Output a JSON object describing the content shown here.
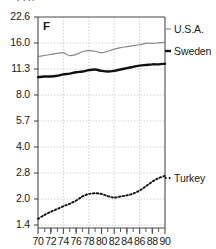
{
  "chart_data": {
    "type": "line",
    "title": "",
    "xlabel": "",
    "ylabel": "F",
    "yscale": "log",
    "ylim": [
      1.4,
      22.6
    ],
    "xlim": [
      70,
      90
    ],
    "grid": true,
    "legend_position": "right-of-plot",
    "y_ticks": [
      "22.6",
      "16.0",
      "11.3",
      "8.0",
      "5.7",
      "4.0",
      "2.8",
      "2.0",
      "1.4"
    ],
    "y_tick_values": [
      22.6,
      16.0,
      11.3,
      8.0,
      5.7,
      4.0,
      2.8,
      2.0,
      1.4
    ],
    "x_ticks": [
      "70",
      "72",
      "74",
      "76",
      "78",
      "80",
      "82",
      "84",
      "86",
      "88",
      "90"
    ],
    "x_tick_values": [
      70,
      72,
      74,
      76,
      78,
      80,
      82,
      84,
      86,
      88,
      90
    ],
    "x_minor_step": 1,
    "unit_label": "F",
    "x": [
      70,
      71,
      72,
      73,
      74,
      75,
      76,
      77,
      78,
      79,
      80,
      81,
      82,
      83,
      84,
      85,
      86,
      87,
      88,
      89,
      90
    ],
    "series": [
      {
        "name": "U.S.A.",
        "style": "thin-solid",
        "color": "#888888",
        "values": [
          13.3,
          13.5,
          13.7,
          13.9,
          14.0,
          13.5,
          13.7,
          14.2,
          14.4,
          14.3,
          14.0,
          14.3,
          14.7,
          15.0,
          15.2,
          15.4,
          15.6,
          15.9,
          15.9,
          16.0,
          16.1
        ]
      },
      {
        "name": "Sweden",
        "style": "thick-solid",
        "color": "#111111",
        "values": [
          10.1,
          10.2,
          10.2,
          10.3,
          10.5,
          10.6,
          10.8,
          10.9,
          11.1,
          11.2,
          11.0,
          10.9,
          11.0,
          11.2,
          11.4,
          11.6,
          11.8,
          11.9,
          12.0,
          12.0,
          12.1
        ]
      },
      {
        "name": "Turkey",
        "style": "dotted",
        "color": "#111111",
        "values": [
          1.52,
          1.6,
          1.67,
          1.73,
          1.8,
          1.86,
          1.94,
          2.05,
          2.12,
          2.14,
          2.12,
          2.06,
          2.02,
          2.05,
          2.08,
          2.13,
          2.22,
          2.35,
          2.5,
          2.62,
          2.7
        ]
      }
    ],
    "legend_entries": [
      {
        "label": "U.S.A."
      },
      {
        "label": "Sweden"
      },
      {
        "label": "Turkey"
      }
    ]
  },
  "axis": {
    "top_clipped_label": "32.0"
  }
}
